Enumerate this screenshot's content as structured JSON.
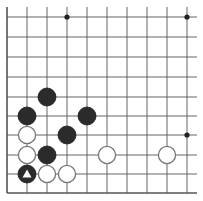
{
  "board": {
    "type": "go-board-corner-diagram",
    "visible_columns": 10,
    "visible_rows": 10,
    "open_edges": [
      "top",
      "right"
    ],
    "closed_edges": [
      "left",
      "bottom"
    ],
    "col_x": [
      7,
      27,
      47,
      67,
      87,
      107,
      127,
      147,
      167,
      187
    ],
    "row_y": [
      17,
      37,
      57,
      77,
      97,
      116,
      135,
      155,
      174,
      193
    ],
    "line_color": "#555555",
    "background": "#ffffff",
    "star_points": [
      {
        "col": 3,
        "row": 0
      },
      {
        "col": 9,
        "row": 0
      },
      {
        "col": 9,
        "row": 6
      }
    ],
    "stones": [
      {
        "color": "black",
        "col": 2,
        "row": 4
      },
      {
        "color": "black",
        "col": 1,
        "row": 5
      },
      {
        "color": "black",
        "col": 4,
        "row": 5
      },
      {
        "color": "black",
        "col": 3,
        "row": 6
      },
      {
        "color": "black",
        "col": 2,
        "row": 7
      },
      {
        "color": "black",
        "col": 1,
        "row": 8,
        "marker": "triangle"
      },
      {
        "color": "white",
        "col": 1,
        "row": 6
      },
      {
        "color": "white",
        "col": 1,
        "row": 7
      },
      {
        "color": "white",
        "col": 5,
        "row": 7
      },
      {
        "color": "white",
        "col": 8,
        "row": 7
      },
      {
        "color": "white",
        "col": 2,
        "row": 8
      },
      {
        "color": "white",
        "col": 3,
        "row": 8
      }
    ],
    "colors": {
      "black_stone": "#2b2b2b",
      "white_stone": "#ffffff",
      "white_stone_outline": "#777777",
      "marker": "#ffffff"
    }
  }
}
